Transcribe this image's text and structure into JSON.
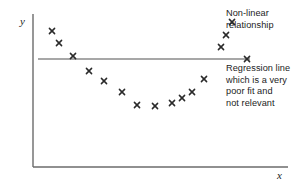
{
  "figure": {
    "background_color": "#ffffff",
    "axis_color": "#6b6b6b",
    "marker_color": "#2a2a2a",
    "line_color": "#8a8a8a",
    "text_color": "#1c1c1c"
  },
  "axes": {
    "y_label": "y",
    "x_label": "x",
    "y_axis": {
      "x": 33,
      "y_top": 14,
      "y_bottom": 167
    },
    "x_axis": {
      "y": 167,
      "x_left": 33,
      "x_right": 288
    }
  },
  "annotations": {
    "nonlinear": "Non-linear\nrelationship",
    "regression": "Regression line\nwhich is a very\npoor fit and\nnot relevant"
  },
  "regression_line": {
    "x_start": 38,
    "x_end": 250,
    "y": 59
  },
  "chart_data": {
    "type": "scatter",
    "title": "",
    "xlabel": "x",
    "ylabel": "y",
    "grid": false,
    "legend": "none",
    "marker": "x",
    "annotations": [
      "Non-linear relationship",
      "Regression line which is a very poor fit and not relevant"
    ],
    "series": [
      {
        "name": "observations",
        "points": [
          [
            52,
            31
          ],
          [
            59,
            43
          ],
          [
            73,
            56
          ],
          [
            89,
            71
          ],
          [
            104,
            81
          ],
          [
            122,
            92
          ],
          [
            137,
            105
          ],
          [
            155,
            106
          ],
          [
            172,
            103
          ],
          [
            182,
            98
          ],
          [
            192,
            92
          ],
          [
            204,
            79
          ],
          [
            221,
            47
          ],
          [
            226,
            35
          ],
          [
            232,
            22
          ],
          [
            247,
            59
          ]
        ]
      },
      {
        "name": "regression-line",
        "type": "line",
        "points": [
          [
            38,
            59
          ],
          [
            250,
            59
          ]
        ]
      }
    ]
  }
}
